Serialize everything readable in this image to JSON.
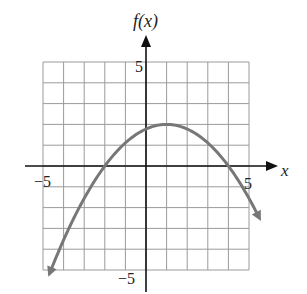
{
  "chart_data": {
    "type": "line",
    "title": "",
    "xlabel": "x",
    "ylabel": "f(x)",
    "xlim": [
      -5,
      5
    ],
    "ylim": [
      -5,
      5
    ],
    "grid": true,
    "x_tick_labels": [
      "-5",
      "5"
    ],
    "y_tick_labels": [
      "5",
      "-5"
    ],
    "series": [
      {
        "name": "f(x)",
        "description": "Downward-opening parabola with vertex (1, 2), x-intercepts -2 and 4, y-intercept 16/9",
        "x": [
          -5,
          -4,
          -3,
          -2,
          -1,
          0,
          1,
          2,
          3,
          4,
          5
        ],
        "y": [
          -6,
          -4,
          -2.22,
          0,
          1.33,
          1.78,
          2,
          1.78,
          1.33,
          0,
          -2.22
        ],
        "color": "#777777"
      }
    ]
  },
  "labels": {
    "y_axis": "f(x)",
    "x_axis": "x",
    "x_min": "−5",
    "x_max": "5",
    "y_max": "5",
    "y_min": "−5"
  }
}
